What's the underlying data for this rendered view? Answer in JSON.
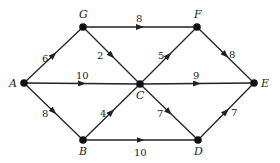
{
  "diagram": {
    "type": "directed-weighted-graph",
    "nodes": [
      {
        "id": "A",
        "label": "A",
        "x": 24,
        "y": 83
      },
      {
        "id": "G",
        "label": "G",
        "x": 83,
        "y": 27
      },
      {
        "id": "F",
        "label": "F",
        "x": 197,
        "y": 27
      },
      {
        "id": "E",
        "label": "E",
        "x": 254,
        "y": 83
      },
      {
        "id": "C",
        "label": "C",
        "x": 140,
        "y": 84
      },
      {
        "id": "B",
        "label": "B",
        "x": 83,
        "y": 140
      },
      {
        "id": "D",
        "label": "D",
        "x": 198,
        "y": 140
      }
    ],
    "edges": [
      {
        "from": "A",
        "to": "G",
        "weight": "6"
      },
      {
        "from": "A",
        "to": "C",
        "weight": "10"
      },
      {
        "from": "A",
        "to": "B",
        "weight": "8"
      },
      {
        "from": "G",
        "to": "F",
        "weight": "8"
      },
      {
        "from": "G",
        "to": "C",
        "weight": "2"
      },
      {
        "from": "B",
        "to": "C",
        "weight": "4"
      },
      {
        "from": "B",
        "to": "D",
        "weight": "10"
      },
      {
        "from": "C",
        "to": "F",
        "weight": "5"
      },
      {
        "from": "C",
        "to": "E",
        "weight": "9"
      },
      {
        "from": "C",
        "to": "D",
        "weight": "7"
      },
      {
        "from": "F",
        "to": "E",
        "weight": "8"
      },
      {
        "from": "D",
        "to": "E",
        "weight": "7"
      }
    ]
  }
}
